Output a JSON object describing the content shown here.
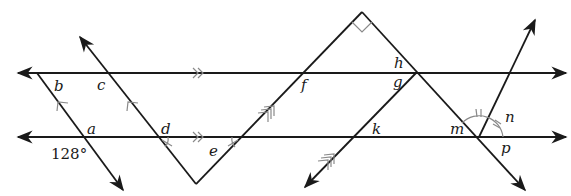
{
  "diagram": {
    "given_angle": "128°",
    "angle_labels": {
      "a": "a",
      "b": "b",
      "c": "c",
      "d": "d",
      "e": "e",
      "f": "f",
      "g": "g",
      "h": "h",
      "k": "k",
      "m": "m",
      "n": "n",
      "p": "p"
    },
    "markings": {
      "parallel_horizontal": "double chevron",
      "parallel_ac_transversals": "single chevron",
      "parallel_fk_lines": "triple tick",
      "right_angle_at_top_vertex": true,
      "congruent_angles_m_n": "double tick arcs",
      "congruent_angles_d_e": "single tick"
    },
    "colors": {
      "line": "#1a1a1a",
      "marking": "#8a8a8a",
      "background": "#ffffff"
    }
  }
}
